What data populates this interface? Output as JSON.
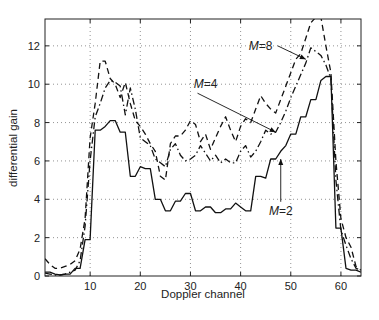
{
  "chart_data": {
    "type": "line",
    "title": "",
    "xlabel": "Doppler channel",
    "ylabel": "differential gain",
    "xlim": [
      1,
      64
    ],
    "ylim": [
      0,
      13.4
    ],
    "xticks": [
      10,
      20,
      30,
      40,
      50,
      60
    ],
    "yticks": [
      0,
      2,
      4,
      6,
      8,
      10,
      12
    ],
    "grid": true,
    "legend": "none (inline annotations)",
    "annotations": [
      {
        "text": "M=8",
        "label_at": [
          44,
          12
        ],
        "arrow_to": [
          53,
          11.3
        ]
      },
      {
        "text": "M=4",
        "label_at": [
          33,
          10
        ],
        "arrow_to": [
          47,
          7.5
        ]
      },
      {
        "text": "M=2",
        "label_at": [
          48,
          3.4
        ],
        "arrow_to": [
          48,
          6.1
        ]
      }
    ],
    "x": [
      1,
      2,
      3,
      4,
      5,
      6,
      7,
      8,
      9,
      10,
      11,
      12,
      13,
      14,
      15,
      16,
      17,
      18,
      19,
      20,
      21,
      22,
      23,
      24,
      25,
      26,
      27,
      28,
      29,
      30,
      31,
      32,
      33,
      34,
      35,
      36,
      37,
      38,
      39,
      40,
      41,
      42,
      43,
      44,
      45,
      46,
      47,
      48,
      49,
      50,
      51,
      52,
      53,
      54,
      55,
      56,
      57,
      58,
      59,
      60,
      61,
      62,
      63,
      64
    ],
    "series": [
      {
        "name": "M=2",
        "style": "solid",
        "values": [
          0.2,
          0.2,
          0.1,
          0.05,
          0.1,
          0.1,
          0.4,
          0.4,
          1.9,
          1.9,
          7.6,
          7.6,
          7.8,
          8.1,
          8.1,
          7.5,
          7.5,
          5.2,
          5.2,
          5.7,
          5.6,
          5.6,
          4.0,
          4.0,
          3.4,
          3.4,
          3.9,
          3.9,
          4.3,
          4.3,
          3.4,
          3.4,
          3.6,
          3.6,
          3.3,
          3.3,
          3.5,
          3.5,
          3.8,
          3.6,
          3.4,
          3.4,
          5.2,
          5.2,
          5.1,
          6.1,
          6.1,
          6.5,
          6.8,
          7.4,
          7.4,
          8.3,
          8.3,
          9.2,
          9.2,
          10.2,
          10.4,
          10.4,
          2.5,
          2.5,
          0.4,
          0.3,
          0.3,
          0.2
        ]
      },
      {
        "name": "M=4",
        "style": "dashdot",
        "values": [
          0.15,
          0.1,
          0.05,
          0.05,
          0.1,
          0.2,
          0.3,
          0.8,
          2.6,
          6.0,
          8.3,
          9.0,
          9.8,
          10.2,
          10.1,
          9.9,
          8.4,
          9.8,
          8.7,
          7.2,
          7.0,
          6.8,
          6.1,
          5.9,
          5.7,
          6.6,
          6.9,
          6.3,
          6.0,
          6.1,
          6.3,
          6.8,
          6.4,
          6.0,
          6.3,
          5.9,
          6.1,
          5.9,
          5.9,
          6.5,
          6.8,
          6.2,
          6.5,
          7.0,
          7.6,
          7.4,
          7.5,
          8.0,
          8.6,
          9.3,
          9.9,
          10.5,
          11.1,
          11.9,
          11.7,
          11.5,
          11.0,
          10.3,
          5.0,
          2.4,
          1.6,
          0.9,
          0.4,
          0.3
        ]
      },
      {
        "name": "M=8",
        "style": "dashed",
        "values": [
          0.9,
          0.6,
          0.4,
          0.4,
          0.5,
          0.6,
          0.8,
          1.4,
          3.0,
          7.2,
          9.0,
          11.2,
          11.2,
          10.3,
          10.0,
          9.3,
          10.1,
          9.0,
          8.1,
          7.8,
          7.4,
          6.9,
          6.5,
          5.2,
          5.0,
          6.9,
          7.3,
          7.3,
          7.6,
          8.1,
          7.9,
          7.0,
          7.4,
          6.6,
          7.2,
          7.8,
          8.3,
          7.6,
          7.0,
          7.8,
          8.2,
          8.0,
          8.7,
          9.4,
          9.0,
          8.7,
          8.5,
          9.2,
          9.9,
          10.6,
          11.3,
          11.6,
          12.4,
          13.2,
          13.5,
          13.5,
          12.0,
          10.6,
          6.0,
          3.0,
          2.0,
          1.5,
          0.5,
          0.3
        ]
      }
    ]
  }
}
